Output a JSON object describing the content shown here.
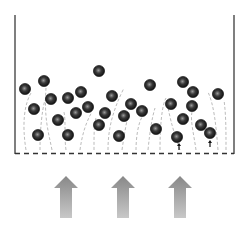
{
  "diagram": {
    "title": "",
    "colors": {
      "wall": "#555555",
      "distributor": "#333333",
      "flow_lines": "#aaaaaa",
      "particle_dark": "#1a1a1a",
      "particle_highlight": "#9a9a9a",
      "arrow_top": "#888888",
      "arrow_bottom": "#c4c4c4"
    },
    "inflow_arrows": [
      {
        "id": "left"
      },
      {
        "id": "center"
      },
      {
        "id": "right"
      }
    ],
    "particle_count": 30
  }
}
